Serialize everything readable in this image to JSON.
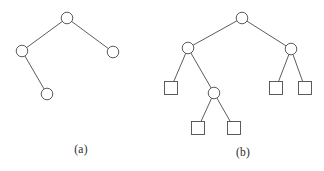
{
  "figure": {
    "background_color": "#ffffff",
    "stroke_color": "#4a4a4a",
    "node_fill_color": "#ffffff",
    "text_color": "#2b2b2b",
    "panel_count": 2
  },
  "panels": [
    {
      "id": "a",
      "caption": "(a)",
      "description": "Tree of four circular nodes",
      "diagram": {
        "type": "tree",
        "node_shape_circle_radius": 5.8,
        "nodes": [
          {
            "id": "a-root",
            "shape": "circle",
            "cx": 67,
            "cy": 18,
            "label": ""
          },
          {
            "id": "a-left",
            "shape": "circle",
            "cx": 22,
            "cy": 51,
            "label": ""
          },
          {
            "id": "a-right",
            "shape": "circle",
            "cx": 113,
            "cy": 52,
            "label": ""
          },
          {
            "id": "a-leaf",
            "shape": "circle",
            "cx": 47,
            "cy": 94,
            "label": ""
          }
        ],
        "edges": [
          {
            "from": "a-root",
            "to": "a-left"
          },
          {
            "from": "a-root",
            "to": "a-right"
          },
          {
            "from": "a-left",
            "to": "a-leaf"
          }
        ]
      }
    },
    {
      "id": "b",
      "caption": "(b)",
      "description": "Binary tree with circular internal nodes and square leaf nodes",
      "diagram": {
        "type": "tree",
        "node_shape_circle_radius": 5.8,
        "node_shape_square_size": 13,
        "nodes": [
          {
            "id": "b-root",
            "shape": "circle",
            "cx": 80,
            "cy": 18,
            "label": ""
          },
          {
            "id": "b-l",
            "shape": "circle",
            "cx": 26,
            "cy": 48,
            "label": ""
          },
          {
            "id": "b-r",
            "shape": "circle",
            "cx": 129,
            "cy": 49,
            "label": ""
          },
          {
            "id": "b-l-leaf",
            "shape": "square",
            "cx": 9,
            "cy": 88,
            "label": ""
          },
          {
            "id": "b-l-mid",
            "shape": "circle",
            "cx": 52,
            "cy": 93,
            "label": ""
          },
          {
            "id": "b-ll-1",
            "shape": "square",
            "cx": 36,
            "cy": 128,
            "label": ""
          },
          {
            "id": "b-ll-2",
            "shape": "square",
            "cx": 72,
            "cy": 128,
            "label": ""
          },
          {
            "id": "b-r-1",
            "shape": "square",
            "cx": 114,
            "cy": 88,
            "label": ""
          },
          {
            "id": "b-r-2",
            "shape": "square",
            "cx": 143,
            "cy": 88,
            "label": ""
          }
        ],
        "edges": [
          {
            "from": "b-root",
            "to": "b-l"
          },
          {
            "from": "b-root",
            "to": "b-r"
          },
          {
            "from": "b-l",
            "to": "b-l-leaf"
          },
          {
            "from": "b-l",
            "to": "b-l-mid"
          },
          {
            "from": "b-l-mid",
            "to": "b-ll-1"
          },
          {
            "from": "b-l-mid",
            "to": "b-ll-2"
          },
          {
            "from": "b-r",
            "to": "b-r-1"
          },
          {
            "from": "b-r",
            "to": "b-r-2"
          }
        ]
      }
    }
  ]
}
